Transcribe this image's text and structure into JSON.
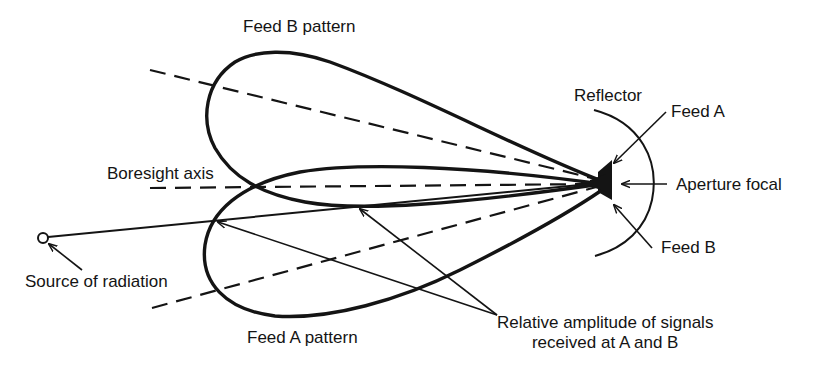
{
  "diagram": {
    "type": "monopulse-amplitude-comparison",
    "labels": {
      "feed_b_pattern": "Feed B pattern",
      "feed_a_pattern": "Feed A pattern",
      "boresight_axis": "Boresight axis",
      "reflector": "Reflector",
      "feed_a": "Feed A",
      "feed_b": "Feed B",
      "aperture_focal": "Aperture focal",
      "source_of_radiation": "Source of radiation",
      "relative_amplitude_line1": "Relative amplitude of signals",
      "relative_amplitude_line2": "received at A and B"
    },
    "colors": {
      "ink": "#141414",
      "background": "#ffffff"
    },
    "geometry": {
      "focus": [
        605,
        182
      ],
      "source": [
        43,
        238
      ],
      "boresight_y": 188
    }
  }
}
